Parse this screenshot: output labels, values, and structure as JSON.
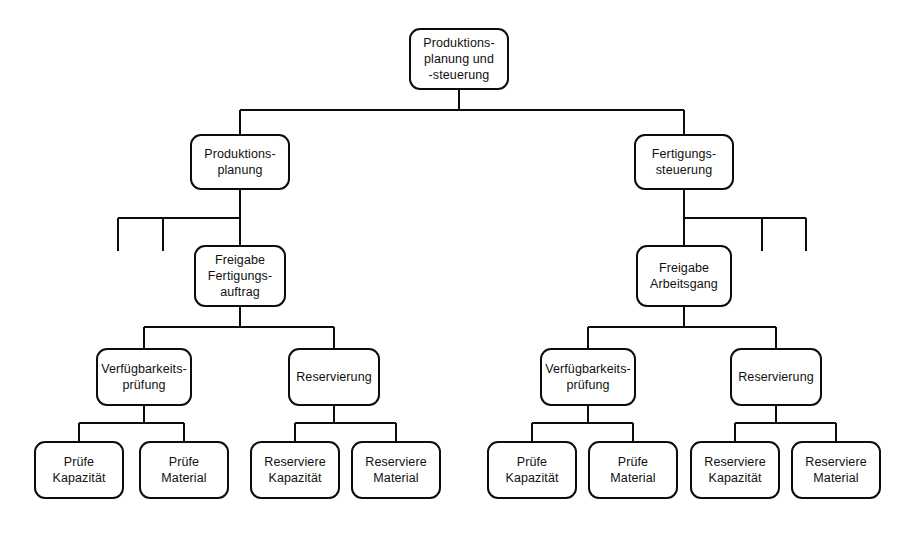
{
  "diagram": {
    "type": "hierarchy-tree",
    "language": "de",
    "background_color": "#ffffff",
    "node_border_color": "#0d0d0d",
    "node_fill_color": "#ffffff",
    "edge_color": "#0d0d0d",
    "levels": 5
  },
  "nodes": {
    "root": {
      "id": "root",
      "label": "Produktions-\nplanung und\n-steuerung",
      "level": 1,
      "x": 409,
      "y": 28,
      "w": 100,
      "h": 62
    },
    "produktionsplanung": {
      "id": "produktionsplanung",
      "label": "Produktions-\nplanung",
      "level": 2,
      "x": 190,
      "y": 134,
      "w": 100,
      "h": 56
    },
    "fertigungssteuerung": {
      "id": "fertigungssteuerung",
      "label": "Fertigungs-\nsteuerung",
      "level": 2,
      "x": 634,
      "y": 134,
      "w": 100,
      "h": 56
    },
    "freigabe_fertigungsauftrag": {
      "id": "freigabe_fertigungsauftrag",
      "label": "Freigabe\nFertigungs-\nauftrag",
      "level": 3,
      "x": 194,
      "y": 245,
      "w": 92,
      "h": 62
    },
    "freigabe_arbeitsgang": {
      "id": "freigabe_arbeitsgang",
      "label": "Freigabe\nArbeitsgang",
      "level": 3,
      "x": 636,
      "y": 245,
      "w": 96,
      "h": 62
    },
    "verfuegbarkeit_links": {
      "id": "verfuegbarkeit_links",
      "label": "Verfügbarkeits-\nprüfung",
      "level": 4,
      "x": 96,
      "y": 348,
      "w": 96,
      "h": 58
    },
    "reservierung_links": {
      "id": "reservierung_links",
      "label": "Reservierung",
      "level": 4,
      "x": 288,
      "y": 348,
      "w": 92,
      "h": 58
    },
    "verfuegbarkeit_rechts": {
      "id": "verfuegbarkeit_rechts",
      "label": "Verfügbarkeits-\nprüfung",
      "level": 4,
      "x": 540,
      "y": 348,
      "w": 96,
      "h": 58
    },
    "reservierung_rechts": {
      "id": "reservierung_rechts",
      "label": "Reservierung",
      "level": 4,
      "x": 730,
      "y": 348,
      "w": 92,
      "h": 58
    },
    "pruefe_kapazitaet_1": {
      "id": "pruefe_kapazitaet_1",
      "label": "Prüfe\nKapazität",
      "level": 5,
      "x": 34,
      "y": 441,
      "w": 90,
      "h": 58
    },
    "pruefe_material_1": {
      "id": "pruefe_material_1",
      "label": "Prüfe\nMaterial",
      "level": 5,
      "x": 139,
      "y": 441,
      "w": 90,
      "h": 58
    },
    "reserviere_kapazitaet_1": {
      "id": "reserviere_kapazitaet_1",
      "label": "Reserviere\nKapazität",
      "level": 5,
      "x": 250,
      "y": 441,
      "w": 90,
      "h": 58
    },
    "reserviere_material_1": {
      "id": "reserviere_material_1",
      "label": "Reserviere\nMaterial",
      "level": 5,
      "x": 351,
      "y": 441,
      "w": 90,
      "h": 58
    },
    "pruefe_kapazitaet_2": {
      "id": "pruefe_kapazitaet_2",
      "label": "Prüfe\nKapazität",
      "level": 5,
      "x": 487,
      "y": 441,
      "w": 90,
      "h": 58
    },
    "pruefe_material_2": {
      "id": "pruefe_material_2",
      "label": "Prüfe\nMaterial",
      "level": 5,
      "x": 588,
      "y": 441,
      "w": 90,
      "h": 58
    },
    "reserviere_kapazitaet_2": {
      "id": "reserviere_kapazitaet_2",
      "label": "Reserviere\nKapazität",
      "level": 5,
      "x": 690,
      "y": 441,
      "w": 90,
      "h": 58
    },
    "reserviere_material_2": {
      "id": "reserviere_material_2",
      "label": "Reserviere\nMaterial",
      "level": 5,
      "x": 791,
      "y": 441,
      "w": 90,
      "h": 58
    }
  },
  "edges": [
    {
      "from": "root",
      "to": "produktionsplanung"
    },
    {
      "from": "root",
      "to": "fertigungssteuerung"
    },
    {
      "from": "produktionsplanung",
      "to": "freigabe_fertigungsauftrag"
    },
    {
      "from": "fertigungssteuerung",
      "to": "freigabe_arbeitsgang"
    },
    {
      "from": "freigabe_fertigungsauftrag",
      "to": "verfuegbarkeit_links"
    },
    {
      "from": "freigabe_fertigungsauftrag",
      "to": "reservierung_links"
    },
    {
      "from": "freigabe_arbeitsgang",
      "to": "verfuegbarkeit_rechts"
    },
    {
      "from": "freigabe_arbeitsgang",
      "to": "reservierung_rechts"
    },
    {
      "from": "verfuegbarkeit_links",
      "to": "pruefe_kapazitaet_1"
    },
    {
      "from": "verfuegbarkeit_links",
      "to": "pruefe_material_1"
    },
    {
      "from": "reservierung_links",
      "to": "reserviere_kapazitaet_1"
    },
    {
      "from": "reservierung_links",
      "to": "reserviere_material_1"
    },
    {
      "from": "verfuegbarkeit_rechts",
      "to": "pruefe_kapazitaet_2"
    },
    {
      "from": "verfuegbarkeit_rechts",
      "to": "pruefe_material_2"
    },
    {
      "from": "reservierung_rechts",
      "to": "reserviere_kapazitaet_2"
    },
    {
      "from": "reservierung_rechts",
      "to": "reserviere_material_2"
    }
  ],
  "stub_branches": {
    "left": {
      "bus_y": 218,
      "bus_x1": 118,
      "bus_x2": 240,
      "stub_bottom": 251,
      "stubs_x": [
        118,
        163
      ]
    },
    "right": {
      "bus_y": 218,
      "bus_x1": 684,
      "bus_x2": 806,
      "stub_bottom": 251,
      "stubs_x": [
        762,
        806
      ]
    }
  }
}
